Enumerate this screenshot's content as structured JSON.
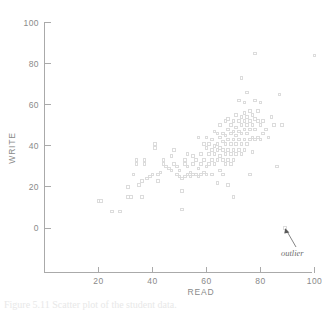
{
  "figure": {
    "background": "#ffffff",
    "marker_color": "#d8d8d8",
    "axis_color": "#aaaaaa",
    "label_color": "#8a8a8a"
  },
  "annotation": {
    "label": "outlier",
    "target_x": 89,
    "target_y": 0
  },
  "caption": {
    "text": "Figure 5.11   Scatter plot of the student data."
  },
  "chart_data": {
    "type": "scatter",
    "title": "",
    "xlabel": "READ",
    "ylabel": "WRITE",
    "xlim": [
      0,
      105
    ],
    "ylim": [
      -20,
      100
    ],
    "xticks": [
      20,
      40,
      60,
      80,
      100
    ],
    "yticks": [
      0,
      20,
      40,
      60,
      80,
      100
    ],
    "grid": false,
    "legend": null,
    "marker": "open-square",
    "series": [
      {
        "name": "students",
        "points": [
          [
            20,
            13
          ],
          [
            21,
            13
          ],
          [
            25,
            8
          ],
          [
            28,
            8
          ],
          [
            31,
            15
          ],
          [
            31,
            20
          ],
          [
            32,
            15
          ],
          [
            33,
            26
          ],
          [
            34,
            31
          ],
          [
            34,
            33
          ],
          [
            35,
            21
          ],
          [
            36,
            15
          ],
          [
            36,
            23
          ],
          [
            37,
            31
          ],
          [
            37,
            33
          ],
          [
            38,
            24
          ],
          [
            39,
            25
          ],
          [
            40,
            26
          ],
          [
            41,
            41
          ],
          [
            41,
            39
          ],
          [
            42,
            23
          ],
          [
            42,
            26
          ],
          [
            43,
            27
          ],
          [
            44,
            33
          ],
          [
            44,
            31
          ],
          [
            45,
            30
          ],
          [
            46,
            29
          ],
          [
            47,
            35
          ],
          [
            47,
            28
          ],
          [
            48,
            38
          ],
          [
            48,
            31
          ],
          [
            49,
            26
          ],
          [
            49,
            30
          ],
          [
            50,
            28
          ],
          [
            50,
            25
          ],
          [
            51,
            9
          ],
          [
            51,
            18
          ],
          [
            51,
            24
          ],
          [
            52,
            25
          ],
          [
            52,
            31
          ],
          [
            52,
            33
          ],
          [
            53,
            26
          ],
          [
            53,
            30
          ],
          [
            53,
            36
          ],
          [
            54,
            25
          ],
          [
            54,
            27
          ],
          [
            55,
            31
          ],
          [
            55,
            26
          ],
          [
            55,
            35
          ],
          [
            56,
            26
          ],
          [
            56,
            33
          ],
          [
            57,
            25
          ],
          [
            57,
            29
          ],
          [
            57,
            44
          ],
          [
            58,
            26
          ],
          [
            58,
            31
          ],
          [
            58,
            36
          ],
          [
            59,
            27
          ],
          [
            59,
            33
          ],
          [
            59,
            41
          ],
          [
            60,
            26
          ],
          [
            60,
            30
          ],
          [
            60,
            39
          ],
          [
            60,
            44
          ],
          [
            61,
            31
          ],
          [
            61,
            36
          ],
          [
            61,
            41
          ],
          [
            62,
            26
          ],
          [
            62,
            33
          ],
          [
            62,
            38
          ],
          [
            62,
            43
          ],
          [
            63,
            31
          ],
          [
            63,
            36
          ],
          [
            63,
            40
          ],
          [
            63,
            47
          ],
          [
            64,
            22
          ],
          [
            64,
            33
          ],
          [
            64,
            38
          ],
          [
            64,
            41
          ],
          [
            64,
            46
          ],
          [
            65,
            28
          ],
          [
            65,
            35
          ],
          [
            65,
            39
          ],
          [
            65,
            44
          ],
          [
            65,
            50
          ],
          [
            66,
            26
          ],
          [
            66,
            33
          ],
          [
            66,
            38
          ],
          [
            66,
            42
          ],
          [
            66,
            46
          ],
          [
            67,
            31
          ],
          [
            67,
            36
          ],
          [
            67,
            41
          ],
          [
            67,
            45
          ],
          [
            67,
            52
          ],
          [
            68,
            21
          ],
          [
            68,
            33
          ],
          [
            68,
            38
          ],
          [
            68,
            43
          ],
          [
            68,
            48
          ],
          [
            68,
            53
          ],
          [
            69,
            31
          ],
          [
            69,
            36
          ],
          [
            69,
            41
          ],
          [
            69,
            46
          ],
          [
            69,
            50
          ],
          [
            70,
            15
          ],
          [
            70,
            33
          ],
          [
            70,
            38
          ],
          [
            70,
            43
          ],
          [
            70,
            47
          ],
          [
            70,
            52
          ],
          [
            71,
            36
          ],
          [
            71,
            41
          ],
          [
            71,
            45
          ],
          [
            71,
            49
          ],
          [
            71,
            55
          ],
          [
            72,
            38
          ],
          [
            72,
            43
          ],
          [
            72,
            47
          ],
          [
            72,
            52
          ],
          [
            72,
            62
          ],
          [
            73,
            36
          ],
          [
            73,
            41
          ],
          [
            73,
            46
          ],
          [
            73,
            50
          ],
          [
            73,
            54
          ],
          [
            73,
            73
          ],
          [
            74,
            38
          ],
          [
            74,
            43
          ],
          [
            74,
            48
          ],
          [
            74,
            52
          ],
          [
            74,
            56
          ],
          [
            74,
            61
          ],
          [
            75,
            41
          ],
          [
            75,
            46
          ],
          [
            75,
            50
          ],
          [
            75,
            54
          ],
          [
            75,
            66
          ],
          [
            76,
            26
          ],
          [
            76,
            43
          ],
          [
            76,
            48
          ],
          [
            76,
            52
          ],
          [
            76,
            57
          ],
          [
            77,
            37
          ],
          [
            77,
            44
          ],
          [
            77,
            50
          ],
          [
            77,
            55
          ],
          [
            78,
            43
          ],
          [
            78,
            48
          ],
          [
            78,
            53
          ],
          [
            78,
            62
          ],
          [
            78,
            85
          ],
          [
            79,
            44
          ],
          [
            79,
            52
          ],
          [
            79,
            57
          ],
          [
            80,
            43
          ],
          [
            80,
            50
          ],
          [
            80,
            61
          ],
          [
            81,
            46
          ],
          [
            81,
            52
          ],
          [
            82,
            48
          ],
          [
            83,
            44
          ],
          [
            84,
            54
          ],
          [
            85,
            50
          ],
          [
            86,
            30
          ],
          [
            87,
            65
          ],
          [
            88,
            50
          ],
          [
            89,
            0
          ],
          [
            100,
            84
          ]
        ]
      }
    ]
  }
}
